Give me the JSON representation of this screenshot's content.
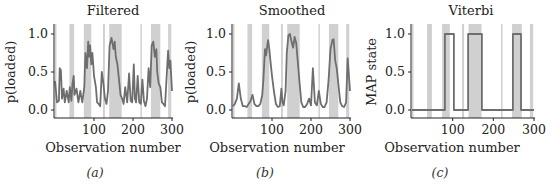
{
  "chart_data": [
    {
      "id": "a",
      "type": "line",
      "title": "Filtered",
      "xlabel": "Observation number",
      "ylabel": "p(loaded)",
      "caption": "(a)",
      "xlim": [
        0,
        300
      ],
      "ylim": [
        -0.05,
        1.05
      ],
      "xticks": [
        100,
        200,
        300
      ],
      "yticks": [
        "0.0",
        "0.5",
        "1.0"
      ],
      "grid": false,
      "line_color": "#6e6e6e",
      "shaded_color": "#c8c8c8",
      "shaded_regions": [
        [
          0,
          2
        ],
        [
          37,
          49
        ],
        [
          74,
          93
        ],
        [
          123,
          128
        ],
        [
          139,
          171
        ],
        [
          219,
          221
        ],
        [
          246,
          270
        ],
        [
          290,
          298
        ]
      ],
      "x": [
        0,
        5,
        10,
        12,
        15,
        18,
        22,
        25,
        30,
        35,
        38,
        42,
        45,
        48,
        50,
        55,
        60,
        65,
        70,
        75,
        78,
        82,
        85,
        88,
        90,
        93,
        96,
        100,
        105,
        108,
        112,
        116,
        120,
        124,
        128,
        132,
        136,
        140,
        145,
        150,
        153,
        156,
        160,
        164,
        168,
        172,
        176,
        180,
        185,
        190,
        194,
        198,
        202,
        205,
        208,
        212,
        216,
        220,
        224,
        228,
        232,
        236,
        240,
        244,
        248,
        252,
        256,
        260,
        262,
        266,
        270,
        274,
        278,
        282,
        286,
        290,
        293,
        296,
        300
      ],
      "values": [
        0.38,
        0.1,
        0.12,
        0.55,
        0.52,
        0.15,
        0.28,
        0.1,
        0.25,
        0.1,
        0.3,
        0.12,
        0.35,
        0.45,
        0.2,
        0.28,
        0.1,
        0.25,
        0.1,
        0.3,
        0.75,
        0.55,
        0.9,
        0.7,
        0.85,
        0.6,
        0.75,
        0.45,
        0.3,
        0.1,
        0.08,
        0.05,
        0.5,
        0.35,
        0.15,
        0.08,
        0.25,
        0.85,
        0.95,
        0.8,
        0.9,
        0.7,
        0.6,
        0.4,
        0.2,
        0.15,
        0.08,
        0.3,
        0.1,
        0.48,
        0.12,
        0.1,
        0.6,
        0.15,
        0.1,
        0.45,
        0.1,
        0.08,
        0.4,
        0.12,
        0.05,
        0.15,
        0.55,
        0.3,
        0.85,
        0.9,
        0.7,
        0.8,
        0.5,
        0.35,
        0.3,
        0.1,
        0.08,
        0.05,
        0.4,
        0.78,
        0.55,
        0.65,
        0.25
      ]
    },
    {
      "id": "b",
      "type": "line",
      "title": "Smoothed",
      "xlabel": "Observation number",
      "ylabel": "p(loaded)",
      "caption": "(b)",
      "xlim": [
        0,
        300
      ],
      "ylim": [
        -0.05,
        1.05
      ],
      "xticks": [
        100,
        200,
        300
      ],
      "yticks": [
        "0.0",
        "0.5",
        "1.0"
      ],
      "grid": false,
      "line_color": "#6e6e6e",
      "shaded_color": "#c8c8c8",
      "shaded_regions": [
        [
          0,
          2
        ],
        [
          37,
          49
        ],
        [
          74,
          93
        ],
        [
          123,
          128
        ],
        [
          139,
          171
        ],
        [
          219,
          221
        ],
        [
          246,
          270
        ],
        [
          290,
          298
        ]
      ],
      "x": [
        0,
        5,
        10,
        15,
        20,
        25,
        30,
        35,
        40,
        45,
        50,
        55,
        60,
        65,
        70,
        75,
        78,
        82,
        85,
        88,
        90,
        93,
        96,
        100,
        105,
        110,
        115,
        120,
        124,
        127,
        130,
        135,
        138,
        142,
        146,
        150,
        154,
        158,
        162,
        166,
        170,
        175,
        180,
        185,
        190,
        195,
        200,
        205,
        210,
        215,
        220,
        225,
        230,
        235,
        240,
        245,
        250,
        255,
        258,
        262,
        266,
        270,
        275,
        280,
        285,
        290,
        294,
        298,
        300
      ],
      "values": [
        0.05,
        0.08,
        0.15,
        0.35,
        0.15,
        0.05,
        0.05,
        0.04,
        0.08,
        0.12,
        0.2,
        0.08,
        0.05,
        0.05,
        0.08,
        0.2,
        0.4,
        0.8,
        0.72,
        0.85,
        0.92,
        0.8,
        0.65,
        0.45,
        0.25,
        0.08,
        0.04,
        0.05,
        0.28,
        0.1,
        0.06,
        0.25,
        0.75,
        0.98,
        1.0,
        0.9,
        0.82,
        0.96,
        0.88,
        0.65,
        0.4,
        0.1,
        0.04,
        0.04,
        0.08,
        0.15,
        0.06,
        0.55,
        0.1,
        0.06,
        0.25,
        0.08,
        0.04,
        0.04,
        0.1,
        0.4,
        0.8,
        0.92,
        0.93,
        0.65,
        0.55,
        0.35,
        0.1,
        0.05,
        0.04,
        0.1,
        0.68,
        0.4,
        0.25
      ]
    },
    {
      "id": "c",
      "type": "line",
      "title": "Viterbi",
      "xlabel": "Observation number",
      "ylabel": "MAP state",
      "caption": "(c)",
      "xlim": [
        0,
        300
      ],
      "ylim": [
        -0.05,
        1.05
      ],
      "xticks": [
        100,
        200,
        300
      ],
      "yticks": [
        "0.0",
        "0.5",
        "1.0"
      ],
      "grid": false,
      "line_color": "#6e6e6e",
      "shaded_color": "#c8c8c8",
      "shaded_regions": [
        [
          0,
          2
        ],
        [
          37,
          49
        ],
        [
          74,
          93
        ],
        [
          123,
          128
        ],
        [
          139,
          171
        ],
        [
          219,
          221
        ],
        [
          246,
          270
        ],
        [
          290,
          298
        ]
      ],
      "x": [
        0,
        81,
        81,
        103,
        103,
        138,
        138,
        172,
        172,
        248,
        248,
        268,
        268,
        300
      ],
      "values": [
        0,
        0,
        1,
        1,
        0,
        0,
        1,
        1,
        0,
        0,
        1,
        1,
        0,
        0
      ]
    }
  ]
}
